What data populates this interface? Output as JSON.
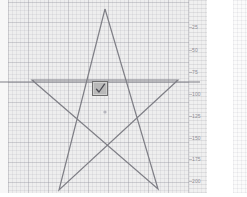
{
  "app": {
    "title": "Graph Canvas",
    "background_color": "#ffffff"
  },
  "canvas": {
    "name": "graph-paper-canvas",
    "background_color": "#eeeeee",
    "fine_grid_step_px": 4,
    "major_grid_step_px": 20,
    "grid_line_color": "#9a9aa0",
    "bounds": {
      "x": 8,
      "y": 0,
      "width": 192,
      "height": 197
    }
  },
  "ruler": {
    "name": "vertical-ruler",
    "orientation": "vertical",
    "unit": "px",
    "background_color": "#f0f0f0",
    "label_color": "#8e8e96",
    "ticks": [
      {
        "label": "25",
        "y": 27
      },
      {
        "label": "50",
        "y": 50
      },
      {
        "label": "75",
        "y": 72
      },
      {
        "label": "100",
        "y": 94
      },
      {
        "label": "125",
        "y": 116
      },
      {
        "label": "150",
        "y": 138
      },
      {
        "label": "175",
        "y": 159
      },
      {
        "label": "200",
        "y": 181
      }
    ]
  },
  "drawing": {
    "name": "star-drawing",
    "stroke_color": "#7f7f86",
    "stroke_width": 1.2,
    "shapes": [
      {
        "name": "five-point-star",
        "type": "polyline",
        "points": "105,9 59,190 178,80 32,80 158,189 105,9"
      },
      {
        "name": "horizontal-guide-line",
        "type": "line",
        "x1": 0,
        "y1": 82,
        "x2": 200,
        "y2": 82
      }
    ],
    "center_dot": {
      "name": "center-point-marker",
      "x": 105,
      "y": 112,
      "r": 1.6,
      "color": "#b4b4bc"
    }
  },
  "checkbox": {
    "name": "checkbox-widget",
    "checked": true,
    "check_glyph": "checkmark-icon",
    "face_color": "#b9b9b9",
    "border_color": "#6e6e6e",
    "check_color": "#4a4a52",
    "position": {
      "x": 92,
      "y": 81,
      "width": 16,
      "height": 15
    }
  },
  "side_panel": {
    "name": "secondary-grid-panel",
    "background_color": "#fbfbfb",
    "fine_grid_step_px": 4
  }
}
